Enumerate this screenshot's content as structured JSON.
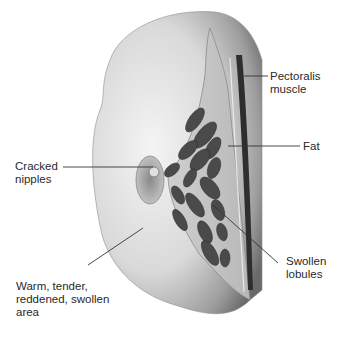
{
  "figure": {
    "labels": {
      "pectoralis_muscle": "Pectoralis\nmuscle",
      "fat": "Fat",
      "cracked_nipples": "Cracked\nnipples",
      "swollen_lobules": "Swollen\nlobules",
      "warm_area": "Warm, tender,\nreddened, swollen\narea"
    }
  }
}
